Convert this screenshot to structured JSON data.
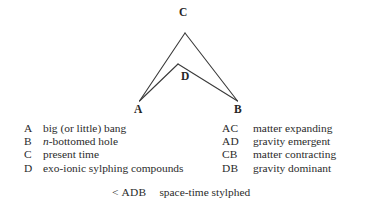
{
  "figure": {
    "name": "space-time-stylphed-diagram",
    "background_color": "#ffffff",
    "stroke_color": "#3a3a3a",
    "text_color": "#262626"
  },
  "diagram": {
    "nodes": [
      {
        "id": "C",
        "label": "C",
        "x": 185,
        "y": 33
      },
      {
        "id": "D",
        "label": "D",
        "x": 178,
        "y": 64
      },
      {
        "id": "A",
        "label": "A",
        "x": 139,
        "y": 101
      },
      {
        "id": "B",
        "label": "B",
        "x": 238,
        "y": 101
      }
    ],
    "edges": [
      {
        "id": "CA",
        "from": "C",
        "to": "A"
      },
      {
        "id": "CB",
        "from": "C",
        "to": "B"
      },
      {
        "id": "DA",
        "from": "D",
        "to": "A"
      },
      {
        "id": "DB",
        "from": "D",
        "to": "B"
      }
    ]
  },
  "legend": {
    "left": [
      {
        "key": "A",
        "desc_pre": "big (or little) bang",
        "desc_italic": "",
        "desc_post": ""
      },
      {
        "key": "B",
        "desc_pre": "",
        "desc_italic": "n",
        "desc_post": "-bottomed hole"
      },
      {
        "key": "C",
        "desc_pre": "present time",
        "desc_italic": "",
        "desc_post": ""
      },
      {
        "key": "D",
        "desc_pre": "exo-ionic sylphing compounds",
        "desc_italic": "",
        "desc_post": ""
      }
    ],
    "right": [
      {
        "key": "AC",
        "desc": "matter expanding"
      },
      {
        "key": "AD",
        "desc": "gravity emergent"
      },
      {
        "key": "CB",
        "desc": "matter contracting"
      },
      {
        "key": "DB",
        "desc": "gravity dominant"
      }
    ],
    "footer": {
      "less_than": "<",
      "key": "ADB",
      "desc": "space-time stylphed"
    }
  }
}
